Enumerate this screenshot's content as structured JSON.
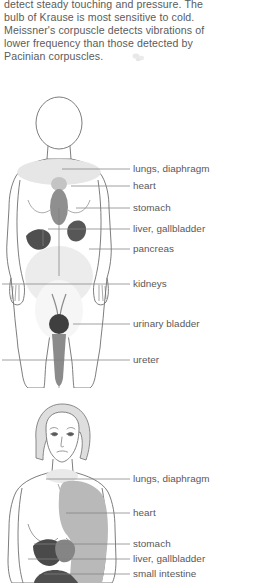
{
  "page": {
    "intro_text": "detect steady touching and pressure. The\nbulb of Krause is most sensitive to cold.\nMeissner's corpuscle detects vibrations of\nlower frequency than those detected by\nPacinian corpuscles."
  },
  "colors": {
    "background": "#ffffff",
    "text": "#5b5b5b",
    "label_text": "#585858",
    "outline": "#6b6b6b",
    "leader_line": "#7a7a7a",
    "organ_dark": "#4e4e4e",
    "organ_mid": "#7e7e7e",
    "organ_light": "#c9c9c9",
    "organ_pale": "#e3e3e3",
    "skin_fill": "#ffffff",
    "hair_fill": "#dcdcdc"
  },
  "figure_anterior": {
    "name": "anterior-whole-body-referred-pain",
    "labels": [
      {
        "id": "lungs-diaphragm",
        "text": "lungs, diaphragm",
        "y": 73,
        "line_x1": 62,
        "line_x2": 130
      },
      {
        "id": "heart",
        "text": "heart",
        "y": 90,
        "line_x1": 71,
        "line_x2": 130
      },
      {
        "id": "stomach",
        "text": "stomach",
        "y": 112,
        "line_x1": 76,
        "line_x2": 130
      },
      {
        "id": "liver-gallbladder",
        "text": "liver, gallbladder",
        "y": 133,
        "line_x1": 48,
        "line_x2": 130
      },
      {
        "id": "pancreas",
        "text": "pancreas",
        "y": 153,
        "line_x1": 89,
        "line_x2": 130
      },
      {
        "id": "kidneys",
        "text": "kidneys",
        "y": 188,
        "line_x1": 2,
        "line_x2": 130
      },
      {
        "id": "urinary-bladder",
        "text": "urinary bladder",
        "y": 228,
        "line_x1": 73,
        "line_x2": 130
      },
      {
        "id": "ureter",
        "text": "ureter",
        "y": 264,
        "line_x1": 2,
        "line_x2": 130
      }
    ],
    "organs": [
      {
        "id": "lungs-diaphragm-region",
        "shade": "pale"
      },
      {
        "id": "heart-region",
        "shade": "light"
      },
      {
        "id": "stomach-region",
        "shade": "mid"
      },
      {
        "id": "liver-gallbladder-region",
        "shade": "dark"
      },
      {
        "id": "pancreas-region",
        "shade": "dark"
      },
      {
        "id": "kidneys-region",
        "shade": "pale"
      },
      {
        "id": "urinary-bladder-region",
        "shade": "dark"
      },
      {
        "id": "ureter-region",
        "shade": "mid"
      }
    ]
  },
  "figure_upper": {
    "name": "upper-body-referred-pain",
    "labels": [
      {
        "id": "lungs-diaphragm",
        "text": "lungs, diaphragm",
        "y": 83,
        "line_x1": 46,
        "line_x2": 130
      },
      {
        "id": "heart",
        "text": "heart",
        "y": 117,
        "line_x1": 66,
        "line_x2": 130
      },
      {
        "id": "stomach",
        "text": "stomach",
        "y": 148,
        "line_x1": 34,
        "line_x2": 130
      },
      {
        "id": "liver-gallbladder",
        "text": "liver, gallbladder",
        "y": 163,
        "line_x1": 28,
        "line_x2": 130
      },
      {
        "id": "small-intestine",
        "text": "small intestine",
        "y": 178,
        "line_x1": 44,
        "line_x2": 130
      }
    ],
    "organs": [
      {
        "id": "chest-arm-region",
        "shade": "light"
      },
      {
        "id": "neck-region",
        "shade": "pale"
      },
      {
        "id": "liver-region",
        "shade": "dark"
      },
      {
        "id": "stomach-region",
        "shade": "mid"
      },
      {
        "id": "small-intestine-region",
        "shade": "dark"
      }
    ]
  }
}
